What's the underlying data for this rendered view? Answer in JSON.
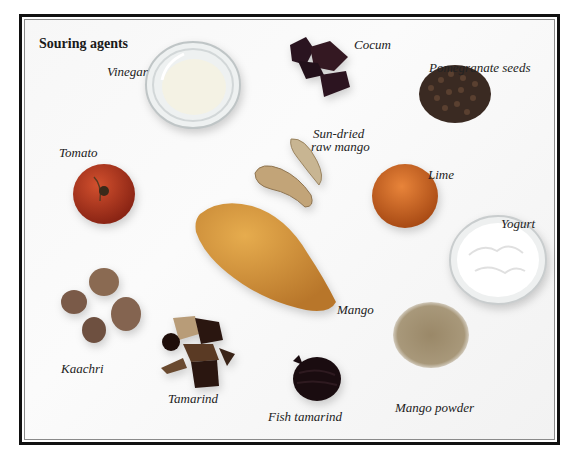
{
  "title": "Souring agents",
  "items": [
    {
      "id": "vinegar",
      "label": "Vinegar",
      "color": "#e8ecec"
    },
    {
      "id": "cocum",
      "label": "Cocum",
      "color": "#2a1420"
    },
    {
      "id": "pomegranate-seeds",
      "label": "Pomegranate seeds",
      "color": "#3a2a22"
    },
    {
      "id": "tomato",
      "label": "Tomato",
      "color": "#b8341c"
    },
    {
      "id": "sun-dried-raw-mango",
      "label_line1": "Sun-dried",
      "label_line2": "raw mango",
      "color": "#c9ab7c"
    },
    {
      "id": "lime",
      "label": "Lime",
      "color": "#d86a1c"
    },
    {
      "id": "yogurt",
      "label": "Yogurt",
      "color": "#fafafa"
    },
    {
      "id": "mango",
      "label": "Mango",
      "color": "#d99a3a"
    },
    {
      "id": "kaachri",
      "label": "Kaachri",
      "color": "#7a5a4a"
    },
    {
      "id": "tamarind",
      "label": "Tamarind",
      "color": "#3a2418"
    },
    {
      "id": "fish-tamarind",
      "label": "Fish tamarind",
      "color": "#1a0c10"
    },
    {
      "id": "mango-powder",
      "label": "Mango powder",
      "color": "#9a8a6a"
    }
  ]
}
